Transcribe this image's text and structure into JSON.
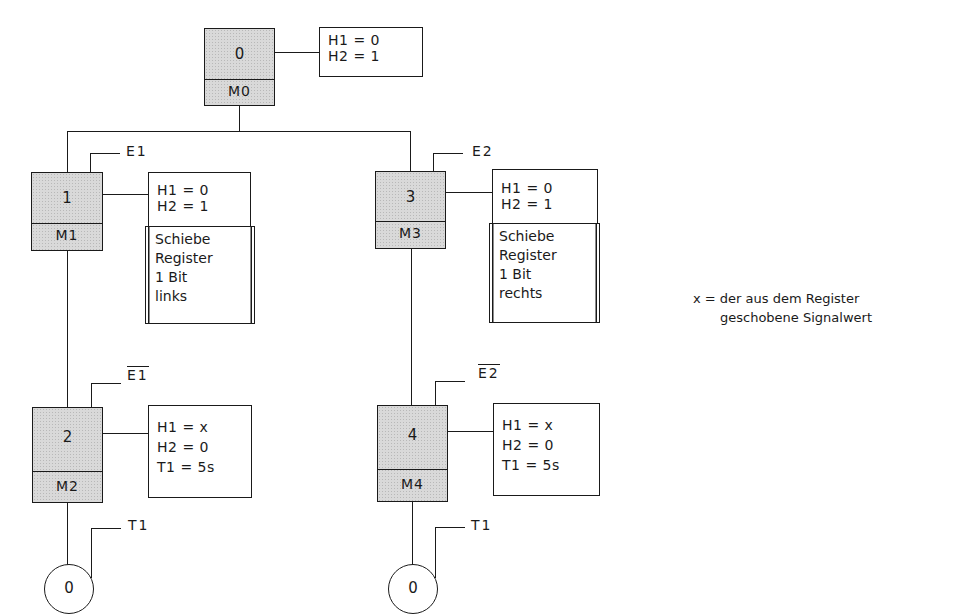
{
  "diagram": {
    "steps": [
      {
        "id": "0",
        "number": "0",
        "memory": "M0",
        "actions": "H1 = 0\nH2 = 1"
      },
      {
        "id": "1",
        "number": "1",
        "memory": "M1",
        "condition": "E1",
        "actions": "H1 = 0\nH2 = 1",
        "extra_action": [
          "Schiebe",
          "Register",
          "1 Bit",
          "links"
        ]
      },
      {
        "id": "2",
        "number": "2",
        "memory": "M2",
        "condition": "E1",
        "condition_negated": true,
        "actions": "H1 = x\nH2 = 0\nT1 = 5s"
      },
      {
        "id": "3",
        "number": "3",
        "memory": "M3",
        "condition": "E2",
        "actions": "H1 = 0\nH2 = 1",
        "extra_action": [
          "Schiebe",
          "Register",
          "1 Bit",
          "rechts"
        ]
      },
      {
        "id": "4",
        "number": "4",
        "memory": "M4",
        "condition": "E2",
        "condition_negated": true,
        "actions": "H1 = x\nH2 = 0\nT1 = 5s"
      }
    ],
    "end_nodes": [
      {
        "label": "0",
        "condition": "T1"
      },
      {
        "label": "0",
        "condition": "T1"
      }
    ],
    "note": {
      "line1": "x = der aus dem Register",
      "line2": "geschobene Signalwert"
    }
  }
}
